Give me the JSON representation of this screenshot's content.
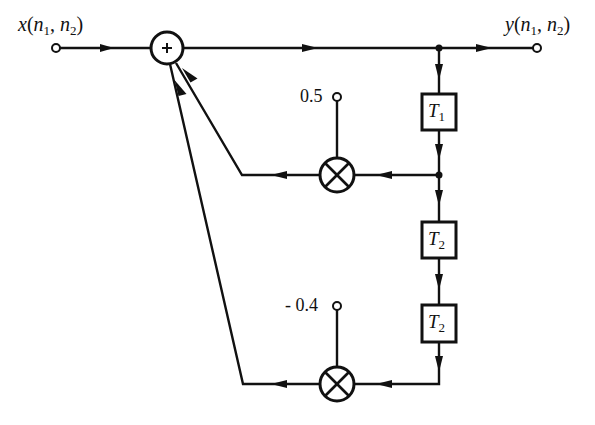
{
  "diagram": {
    "type": "signal-flow-block-diagram",
    "input": {
      "label": "x(n1, n2)",
      "func": "x",
      "args": [
        "n",
        "1",
        "n",
        "2"
      ]
    },
    "output": {
      "label": "y(n1, n2)",
      "func": "y",
      "args": [
        "n",
        "1",
        "n",
        "2"
      ]
    },
    "summer": {
      "symbol": "+"
    },
    "delays": [
      {
        "id": "T1",
        "base": "T",
        "sub": "1"
      },
      {
        "id": "T2a",
        "base": "T",
        "sub": "2"
      },
      {
        "id": "T2b",
        "base": "T",
        "sub": "2"
      }
    ],
    "multipliers": [
      {
        "id": "mult-1",
        "coefficient": "0.5"
      },
      {
        "id": "mult-2",
        "coefficient": "- 0.4"
      }
    ],
    "colors": {
      "ink": "#111111",
      "background": "#ffffff"
    }
  }
}
